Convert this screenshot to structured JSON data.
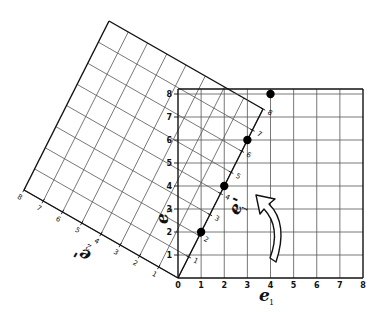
{
  "figure": {
    "standard_axes": {
      "x_axis_label": "e",
      "x_axis_subscript": "1",
      "y_axis_label": "e",
      "y_axis_subscript": "2",
      "x_ticks": [
        "0",
        "1",
        "2",
        "3",
        "4",
        "5",
        "6",
        "7",
        "8"
      ],
      "y_ticks": [
        "1",
        "2",
        "3",
        "4",
        "5",
        "6",
        "7",
        "8"
      ]
    },
    "rotated_axes": {
      "e1_prime_label": "e'",
      "e1_prime_subscript": "1",
      "e2_prime_label": "e'",
      "e2_prime_subscript": "2",
      "e1_prime_ticks": [
        "1",
        "2",
        "3",
        "4",
        "5",
        "6",
        "7",
        "8"
      ],
      "e2_prime_ticks": [
        "1",
        "2",
        "3",
        "4",
        "5",
        "6",
        "7",
        "8"
      ]
    },
    "points": [
      {
        "x": 1,
        "y": 2
      },
      {
        "x": 2,
        "y": 4
      },
      {
        "x": 3,
        "y": 6
      },
      {
        "x": 4,
        "y": 8
      }
    ],
    "rotation_arrow": "counterclockwise-arrow",
    "colors": {
      "line": "#111111",
      "grid": "#555555",
      "background": "#ffffff"
    }
  }
}
